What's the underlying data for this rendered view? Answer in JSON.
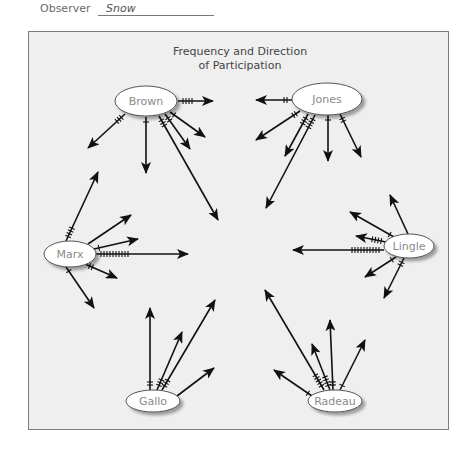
{
  "observer": {
    "label": "Observer",
    "value": "Snow"
  },
  "diagram": {
    "title_line1": "Frequency and Direction",
    "title_line2": "of Participation",
    "nodes": [
      {
        "id": "brown",
        "label": "Brown",
        "cx": 146,
        "cy": 101,
        "rx": 31,
        "ry": 15
      },
      {
        "id": "jones",
        "label": "Jones",
        "cx": 327,
        "cy": 99,
        "rx": 35,
        "ry": 16
      },
      {
        "id": "marx",
        "label": "Marx",
        "cx": 70,
        "cy": 254,
        "rx": 26,
        "ry": 13
      },
      {
        "id": "lingle",
        "label": "Lingle",
        "cx": 409,
        "cy": 246,
        "rx": 25,
        "ry": 12
      },
      {
        "id": "gallo",
        "label": "Gallo",
        "cx": 153,
        "cy": 401,
        "rx": 27,
        "ry": 11
      },
      {
        "id": "radeau",
        "label": "Radeau",
        "cx": 335,
        "cy": 401,
        "rx": 27,
        "ry": 11
      }
    ],
    "arrows": [
      {
        "from": "brown",
        "x1": 178,
        "y1": 101,
        "x2": 213,
        "y2": 101,
        "ticks": 4
      },
      {
        "from": "brown",
        "x1": 125,
        "y1": 114,
        "x2": 88,
        "y2": 148,
        "ticks": 3
      },
      {
        "from": "brown",
        "x1": 146,
        "y1": 117,
        "x2": 146,
        "y2": 173,
        "ticks": 1
      },
      {
        "from": "brown",
        "x1": 170,
        "y1": 112,
        "x2": 205,
        "y2": 137,
        "ticks": 1
      },
      {
        "from": "brown",
        "x1": 165,
        "y1": 114,
        "x2": 190,
        "y2": 149,
        "ticks": 2
      },
      {
        "from": "brown",
        "x1": 159,
        "y1": 116,
        "x2": 218,
        "y2": 220,
        "ticks": 3
      },
      {
        "from": "jones",
        "x1": 292,
        "y1": 100,
        "x2": 256,
        "y2": 100,
        "ticks": 2
      },
      {
        "from": "jones",
        "x1": 300,
        "y1": 111,
        "x2": 256,
        "y2": 140,
        "ticks": 2
      },
      {
        "from": "jones",
        "x1": 308,
        "y1": 114,
        "x2": 285,
        "y2": 156,
        "ticks": 3
      },
      {
        "from": "jones",
        "x1": 315,
        "y1": 115,
        "x2": 266,
        "y2": 208,
        "ticks": 4
      },
      {
        "from": "jones",
        "x1": 328,
        "y1": 115,
        "x2": 328,
        "y2": 161,
        "ticks": 1
      },
      {
        "from": "jones",
        "x1": 340,
        "y1": 114,
        "x2": 361,
        "y2": 157,
        "ticks": 2
      },
      {
        "from": "marx",
        "x1": 66,
        "y1": 241,
        "x2": 98,
        "y2": 172,
        "ticks": 4
      },
      {
        "from": "marx",
        "x1": 88,
        "y1": 244,
        "x2": 131,
        "y2": 215,
        "ticks": 0
      },
      {
        "from": "marx",
        "x1": 94,
        "y1": 249,
        "x2": 138,
        "y2": 239,
        "ticks": 1
      },
      {
        "from": "marx",
        "x1": 96,
        "y1": 254,
        "x2": 188,
        "y2": 254,
        "ticks": 10
      },
      {
        "from": "marx",
        "x1": 85,
        "y1": 264,
        "x2": 117,
        "y2": 278,
        "ticks": 2
      },
      {
        "from": "marx",
        "x1": 66,
        "y1": 267,
        "x2": 94,
        "y2": 308,
        "ticks": 1
      },
      {
        "from": "lingle",
        "x1": 408,
        "y1": 234,
        "x2": 390,
        "y2": 195,
        "ticks": 0
      },
      {
        "from": "lingle",
        "x1": 394,
        "y1": 237,
        "x2": 350,
        "y2": 212,
        "ticks": 1
      },
      {
        "from": "lingle",
        "x1": 386,
        "y1": 242,
        "x2": 356,
        "y2": 236,
        "ticks": 4
      },
      {
        "from": "lingle",
        "x1": 384,
        "y1": 250,
        "x2": 293,
        "y2": 250,
        "ticks": 10
      },
      {
        "from": "lingle",
        "x1": 396,
        "y1": 257,
        "x2": 365,
        "y2": 277,
        "ticks": 1
      },
      {
        "from": "lingle",
        "x1": 404,
        "y1": 258,
        "x2": 384,
        "y2": 298,
        "ticks": 2
      },
      {
        "from": "gallo",
        "x1": 150,
        "y1": 390,
        "x2": 150,
        "y2": 308,
        "ticks": 2
      },
      {
        "from": "gallo",
        "x1": 157,
        "y1": 390,
        "x2": 182,
        "y2": 332,
        "ticks": 3
      },
      {
        "from": "gallo",
        "x1": 162,
        "y1": 390,
        "x2": 215,
        "y2": 300,
        "ticks": 3
      },
      {
        "from": "gallo",
        "x1": 177,
        "y1": 396,
        "x2": 214,
        "y2": 368,
        "ticks": 0
      },
      {
        "from": "radeau",
        "x1": 324,
        "y1": 390,
        "x2": 265,
        "y2": 290,
        "ticks": 5
      },
      {
        "from": "radeau",
        "x1": 330,
        "y1": 390,
        "x2": 312,
        "y2": 344,
        "ticks": 4
      },
      {
        "from": "radeau",
        "x1": 333,
        "y1": 390,
        "x2": 330,
        "y2": 320,
        "ticks": 2
      },
      {
        "from": "radeau",
        "x1": 340,
        "y1": 390,
        "x2": 365,
        "y2": 340,
        "ticks": 1
      },
      {
        "from": "radeau",
        "x1": 312,
        "y1": 396,
        "x2": 274,
        "y2": 370,
        "ticks": 1
      }
    ]
  },
  "colors": {
    "frame_bg": "#efefef",
    "frame_border": "#7c7c7c",
    "arrow": "#111111",
    "node_fill": "#ffffff",
    "node_stroke": "#555555",
    "node_shadow": "#bdbdbd",
    "node_text": "#8a8a8a"
  }
}
